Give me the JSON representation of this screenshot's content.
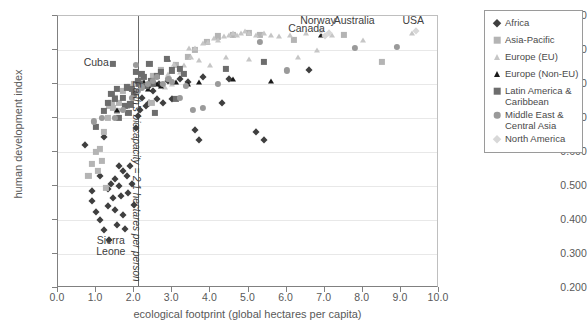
{
  "chart": {
    "type": "scatter",
    "title": "",
    "xlabel": "ecological footprint (global hectares per capita)",
    "ylabel": "human development index",
    "xlim": [
      0.0,
      10.0
    ],
    "ylim": [
      0.2,
      1.0
    ],
    "xticks": [
      "0.0",
      "1.0",
      "2.0",
      "3.0",
      "4.0",
      "5.0",
      "6.0",
      "7.0",
      "8.0",
      "9.0",
      "10.0"
    ],
    "yticks": [
      "0.200",
      "0.300",
      "0.400",
      "0.500",
      "0.600",
      "0.700",
      "0.800",
      "0.900",
      "1.000"
    ],
    "grid": "horizontal",
    "legend_position": "right-outside"
  },
  "annotations": {
    "cuba": "Cuba",
    "sierra_leone": "Sierra\nLeone",
    "sierra_leone_line1": "Sierra",
    "sierra_leone_line2": "Leone",
    "norway": "Norway",
    "canada": "Canada",
    "australia": "Australia",
    "usa": "USA",
    "biocapacity": "Earth's biocapacity = 2.1 hectares per person",
    "biocapacity_value": 2.1
  },
  "legend": {
    "items": [
      {
        "label": "Africa",
        "marker": "diamond",
        "color": "#3f3f3f"
      },
      {
        "label": "Asia-Pacific",
        "marker": "square",
        "color": "#b4b4b4"
      },
      {
        "label": "Europe (EU)",
        "marker": "triangle",
        "color": "#c6c6c6"
      },
      {
        "label": "Europe (Non-EU)",
        "marker": "triangle",
        "color": "#1a1a1a"
      },
      {
        "label": "Latin America & Caribbean",
        "marker": "square",
        "color": "#6d6d6d"
      },
      {
        "label": "Middle East & Central Asia",
        "marker": "circle",
        "color": "#9a9a9a"
      },
      {
        "label": "North America",
        "marker": "diamond",
        "color": "#d8d8d8"
      }
    ]
  },
  "chart_data": {
    "type": "scatter",
    "title": "",
    "xlabel": "ecological footprint (global hectares per capita)",
    "ylabel": "human development index",
    "xlim": [
      0.0,
      10.0
    ],
    "ylim": [
      0.2,
      1.0
    ],
    "reference_line_x": 2.1,
    "reference_line_label": "Earth's biocapacity = 2.1 hectares per person",
    "series": [
      {
        "name": "Africa",
        "marker": "diamond",
        "color": "#3f3f3f",
        "points": [
          [
            0.7,
            0.62
          ],
          [
            0.9,
            0.485
          ],
          [
            0.9,
            0.455
          ],
          [
            1.0,
            0.425
          ],
          [
            1.1,
            0.53
          ],
          [
            1.1,
            0.4
          ],
          [
            1.2,
            0.645
          ],
          [
            1.2,
            0.37
          ],
          [
            1.3,
            0.49
          ],
          [
            1.3,
            0.44
          ],
          [
            1.35,
            0.34
          ],
          [
            1.4,
            0.505
          ],
          [
            1.45,
            0.465
          ],
          [
            1.5,
            0.52
          ],
          [
            1.5,
            0.43
          ],
          [
            1.55,
            0.385
          ],
          [
            1.6,
            0.56
          ],
          [
            1.6,
            0.5
          ],
          [
            1.65,
            0.47
          ],
          [
            1.7,
            0.545
          ],
          [
            1.7,
            0.415
          ],
          [
            1.75,
            0.375
          ],
          [
            1.8,
            0.53
          ],
          [
            1.85,
            0.48
          ],
          [
            1.9,
            0.56
          ],
          [
            1.95,
            0.505
          ],
          [
            2.0,
            0.445
          ],
          [
            2.05,
            0.67
          ],
          [
            2.1,
            0.705
          ],
          [
            2.15,
            0.725
          ],
          [
            2.2,
            0.76
          ],
          [
            2.3,
            0.735
          ],
          [
            2.35,
            0.79
          ],
          [
            2.4,
            0.745
          ],
          [
            2.5,
            0.78
          ],
          [
            2.6,
            0.755
          ],
          [
            2.65,
            0.8
          ],
          [
            2.75,
            0.745
          ],
          [
            2.9,
            0.81
          ],
          [
            3.0,
            0.755
          ],
          [
            3.2,
            0.815
          ],
          [
            3.4,
            0.805
          ],
          [
            3.6,
            0.665
          ],
          [
            3.7,
            0.635
          ],
          [
            3.8,
            0.82
          ],
          [
            4.3,
            0.745
          ],
          [
            4.5,
            0.815
          ],
          [
            5.2,
            0.66
          ],
          [
            5.4,
            0.635
          ],
          [
            6.6,
            0.84
          ]
        ]
      },
      {
        "name": "Asia-Pacific",
        "marker": "square",
        "color": "#b4b4b4",
        "points": [
          [
            0.8,
            0.53
          ],
          [
            0.9,
            0.565
          ],
          [
            1.0,
            0.6
          ],
          [
            1.05,
            0.545
          ],
          [
            1.1,
            0.61
          ],
          [
            1.15,
            0.575
          ],
          [
            1.2,
            0.66
          ],
          [
            1.3,
            0.7
          ],
          [
            1.35,
            0.735
          ],
          [
            1.4,
            0.745
          ],
          [
            1.45,
            0.73
          ],
          [
            1.5,
            0.76
          ],
          [
            1.55,
            0.72
          ],
          [
            1.6,
            0.745
          ],
          [
            1.7,
            0.78
          ],
          [
            1.8,
            0.735
          ],
          [
            1.9,
            0.79
          ],
          [
            2.0,
            0.8
          ],
          [
            2.1,
            0.805
          ],
          [
            2.2,
            0.815
          ],
          [
            2.3,
            0.795
          ],
          [
            2.5,
            0.825
          ],
          [
            2.7,
            0.84
          ],
          [
            3.1,
            0.855
          ],
          [
            3.4,
            0.88
          ],
          [
            3.6,
            0.9
          ],
          [
            3.9,
            0.925
          ],
          [
            4.2,
            0.94
          ],
          [
            4.6,
            0.945
          ],
          [
            5.0,
            0.95
          ],
          [
            5.3,
            0.945
          ],
          [
            6.2,
            0.93
          ],
          [
            7.5,
            0.945
          ],
          [
            8.5,
            0.865
          ],
          [
            1.25,
            0.495
          ],
          [
            2.45,
            0.745
          ]
        ]
      },
      {
        "name": "Europe (EU)",
        "marker": "triangle",
        "color": "#c6c6c6",
        "points": [
          [
            2.8,
            0.79
          ],
          [
            3.0,
            0.8
          ],
          [
            3.2,
            0.835
          ],
          [
            3.3,
            0.855
          ],
          [
            3.5,
            0.88
          ],
          [
            3.6,
            0.905
          ],
          [
            3.8,
            0.92
          ],
          [
            3.95,
            0.925
          ],
          [
            4.1,
            0.935
          ],
          [
            4.2,
            0.93
          ],
          [
            4.35,
            0.94
          ],
          [
            4.5,
            0.945
          ],
          [
            4.6,
            0.95
          ],
          [
            4.7,
            0.945
          ],
          [
            4.8,
            0.95
          ],
          [
            4.9,
            0.955
          ],
          [
            5.0,
            0.95
          ],
          [
            5.2,
            0.945
          ],
          [
            5.4,
            0.95
          ],
          [
            5.6,
            0.945
          ],
          [
            5.8,
            0.94
          ],
          [
            6.1,
            0.945
          ],
          [
            6.5,
            0.95
          ],
          [
            6.8,
            0.9
          ],
          [
            4.4,
            0.88
          ],
          [
            3.7,
            0.87
          ],
          [
            3.05,
            0.86
          ],
          [
            4.0,
            0.855
          ],
          [
            5.0,
            0.875
          ],
          [
            6.3,
            0.88
          ],
          [
            7.2,
            0.945
          ],
          [
            8.0,
            0.93
          ],
          [
            9.3,
            0.95
          ],
          [
            2.9,
            0.83
          ],
          [
            3.45,
            0.905
          ]
        ]
      },
      {
        "name": "Europe (Non-EU)",
        "marker": "triangle",
        "color": "#1a1a1a",
        "points": [
          [
            1.55,
            0.725
          ],
          [
            2.25,
            0.805
          ],
          [
            2.6,
            0.8
          ],
          [
            2.9,
            0.875
          ],
          [
            3.1,
            0.805
          ],
          [
            3.4,
            0.8
          ],
          [
            3.7,
            0.805
          ],
          [
            4.6,
            0.815
          ],
          [
            5.6,
            0.81
          ],
          [
            6.9,
            0.945
          ],
          [
            2.35,
            0.785
          ],
          [
            2.7,
            0.795
          ]
        ]
      },
      {
        "name": "Latin America & Caribbean",
        "marker": "square",
        "color": "#6d6d6d",
        "points": [
          [
            1.0,
            0.675
          ],
          [
            1.2,
            0.72
          ],
          [
            1.3,
            0.745
          ],
          [
            1.4,
            0.77
          ],
          [
            1.5,
            0.755
          ],
          [
            1.55,
            0.785
          ],
          [
            1.6,
            0.7
          ],
          [
            1.7,
            0.76
          ],
          [
            1.75,
            0.735
          ],
          [
            1.8,
            0.79
          ],
          [
            1.85,
            0.715
          ],
          [
            1.9,
            0.74
          ],
          [
            1.95,
            0.785
          ],
          [
            2.0,
            0.77
          ],
          [
            2.05,
            0.835
          ],
          [
            2.1,
            0.81
          ],
          [
            2.15,
            0.8
          ],
          [
            2.2,
            0.83
          ],
          [
            2.25,
            0.82
          ],
          [
            2.3,
            0.795
          ],
          [
            2.4,
            0.86
          ],
          [
            2.45,
            0.81
          ],
          [
            2.5,
            0.8
          ],
          [
            2.6,
            0.825
          ],
          [
            2.7,
            0.835
          ],
          [
            2.85,
            0.875
          ],
          [
            3.0,
            0.84
          ],
          [
            3.1,
            0.755
          ],
          [
            3.2,
            0.845
          ],
          [
            3.3,
            0.83
          ],
          [
            4.4,
            0.845
          ],
          [
            5.4,
            0.865
          ],
          [
            1.45,
            0.86
          ],
          [
            2.55,
            0.715
          ]
        ]
      },
      {
        "name": "Middle East & Central Asia",
        "marker": "circle",
        "color": "#9a9a9a",
        "points": [
          [
            0.95,
            0.69
          ],
          [
            1.15,
            0.7
          ],
          [
            1.5,
            0.7
          ],
          [
            1.7,
            0.725
          ],
          [
            1.95,
            0.76
          ],
          [
            2.1,
            0.78
          ],
          [
            2.2,
            0.79
          ],
          [
            2.35,
            0.8
          ],
          [
            2.5,
            0.81
          ],
          [
            2.6,
            0.82
          ],
          [
            2.75,
            0.8
          ],
          [
            3.0,
            0.805
          ],
          [
            3.2,
            0.76
          ],
          [
            3.35,
            0.795
          ],
          [
            3.55,
            0.725
          ],
          [
            3.8,
            0.73
          ],
          [
            4.2,
            0.8
          ],
          [
            5.3,
            0.925
          ],
          [
            6.0,
            0.84
          ],
          [
            7.8,
            0.905
          ],
          [
            8.9,
            0.91
          ],
          [
            2.05,
            0.855
          ],
          [
            2.9,
            0.815
          ]
        ]
      },
      {
        "name": "North America",
        "marker": "diamond",
        "color": "#d8d8d8",
        "points": [
          [
            6.9,
            0.955
          ],
          [
            7.1,
            0.95
          ],
          [
            9.4,
            0.955
          ],
          [
            7.0,
            0.94
          ]
        ]
      }
    ]
  }
}
